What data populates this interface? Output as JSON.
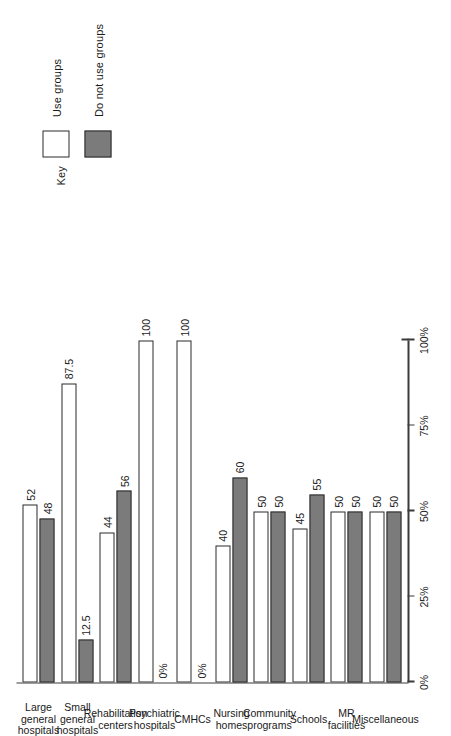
{
  "legend": {
    "title": "Key",
    "items": [
      {
        "label": "Use groups",
        "swatch": "white-square-swatch",
        "color": "#ffffff"
      },
      {
        "label": "Do not use groups",
        "swatch": "gray-square-swatch",
        "color": "#7b7b7b"
      }
    ]
  },
  "axis": {
    "ticks": [
      "0%",
      "25%",
      "50%",
      "75%",
      "100%"
    ],
    "tick_values": [
      0,
      25,
      50,
      75,
      100
    ]
  },
  "chart_data": {
    "type": "bar",
    "title": "",
    "xlabel": "",
    "ylabel": "",
    "ylim": [
      0,
      100
    ],
    "grid": false,
    "orientation": "horizontal",
    "legend_position": "top-left",
    "categories": [
      "Large general hospitals",
      "Small general hospitals",
      "Rehabilitation centers",
      "Psychiatric hospitals",
      "CMHCs",
      "Nursing homes",
      "Community programs",
      "Schools",
      "MR facilities",
      "Miscellaneous"
    ],
    "series": [
      {
        "name": "Use groups",
        "values": [
          52,
          87.5,
          44,
          100,
          100,
          40,
          50,
          45,
          50,
          50
        ],
        "labels": [
          "52",
          "87.5",
          "44",
          "100",
          "100",
          "40",
          "50",
          "45",
          "50",
          "50"
        ]
      },
      {
        "name": "Do not use groups",
        "values": [
          48,
          12.5,
          56,
          0,
          0,
          60,
          50,
          55,
          50,
          50
        ],
        "labels": [
          "48",
          "12.5",
          "56",
          "0%",
          "0%",
          "60",
          "50",
          "55",
          "50",
          "50"
        ]
      }
    ]
  }
}
